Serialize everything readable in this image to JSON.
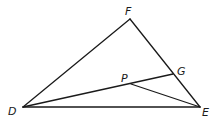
{
  "diagram": {
    "type": "geometry-triangle",
    "points": {
      "F": {
        "label": "F",
        "x": 130,
        "y": 19,
        "label_x": 125,
        "label_y": 15
      },
      "D": {
        "label": "D",
        "x": 23,
        "y": 107,
        "label_x": 8,
        "label_y": 115
      },
      "E": {
        "label": "E",
        "x": 200,
        "y": 107,
        "label_x": 202,
        "label_y": 116
      },
      "G": {
        "label": "G",
        "x": 173,
        "y": 74,
        "label_x": 177,
        "label_y": 75
      },
      "P": {
        "label": "P",
        "x": 131,
        "y": 84,
        "label_x": 121,
        "label_y": 82
      }
    },
    "segments": [
      {
        "from": "D",
        "to": "F"
      },
      {
        "from": "F",
        "to": "E"
      },
      {
        "from": "D",
        "to": "E"
      },
      {
        "from": "D",
        "to": "G"
      },
      {
        "from": "P",
        "to": "E"
      }
    ],
    "stroke_color": "#1a1a1a"
  }
}
